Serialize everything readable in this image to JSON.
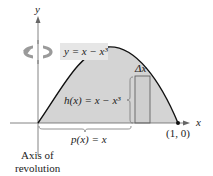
{
  "diagram": {
    "axes": {
      "x_label": "x",
      "y_label": "y"
    },
    "curve_label": "y = x − x³",
    "height_label": "h(x) = x − x³",
    "radius_label": "p(x) = x",
    "delta_label": "Δx",
    "point_label": "(1, 0)",
    "axis_caption_line1": "Axis of",
    "axis_caption_line2": "revolution",
    "icons": [
      "rotation-arrow-icon"
    ],
    "colors": {
      "region_fill": "#d4d4d4",
      "rect_fill": "#cfcfcf",
      "curve": "#111111",
      "label_bg": "#e6e6e6"
    }
  }
}
